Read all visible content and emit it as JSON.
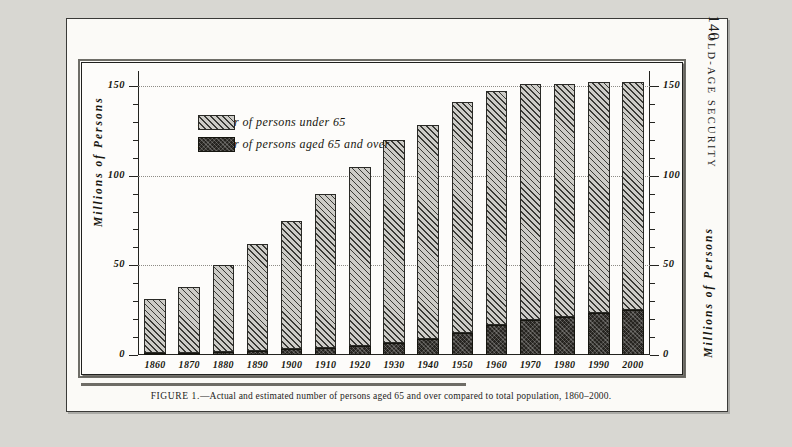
{
  "page": {
    "folio": "140",
    "running_head": "OLD-AGE SECURITY"
  },
  "figure": {
    "caption_label": "FIGURE 1.",
    "caption_text": "—Actual and estimated number of persons aged 65 and over compared to total population, 1860–2000."
  },
  "legend": {
    "items": [
      {
        "label": "Number of persons under 65",
        "pattern": "hatched",
        "color": "#cdccc7"
      },
      {
        "label": "Number of persons aged 65 and over",
        "pattern": "solid-dark",
        "color": "#262420"
      }
    ]
  },
  "ghost_text": {
    "line1": "",
    "line2": "",
    "line3": ""
  },
  "chart_data": {
    "type": "bar",
    "subtype": "stacked",
    "title": "",
    "xlabel": "",
    "ylabel": "Millions of Persons",
    "ylabel_right": "Millions of Persons",
    "ylim": [
      0,
      155
    ],
    "yticks_major": [
      0,
      50,
      100,
      150
    ],
    "ytick_labels": [
      "0",
      "50",
      "100",
      "150"
    ],
    "ytick_minor_step": 10,
    "grid": true,
    "grid_style": "dotted",
    "legend_position": "upper-left-inside",
    "categories": [
      "1860",
      "1870",
      "1880",
      "1890",
      "1900",
      "1910",
      "1920",
      "1930",
      "1940",
      "1950",
      "1960",
      "1970",
      "1980",
      "1990",
      "2000"
    ],
    "series": [
      {
        "name": "Number of persons aged 65 and over",
        "color": "#262420",
        "values": [
          1,
          1.2,
          1.7,
          2.4,
          3.1,
          4.0,
          4.9,
          6.6,
          9.0,
          12.3,
          16.6,
          19.6,
          21.4,
          23.2,
          25.0
        ]
      },
      {
        "name": "Number of persons under 65",
        "color": "#cdccc7",
        "values": [
          30.4,
          37.3,
          48.5,
          60.5,
          72.9,
          88.0,
          101.8,
          116.1,
          122.7,
          139.0,
          149.1,
          153.9,
          155.6,
          157.4,
          159.2
        ]
      }
    ],
    "totals": [
      31.4,
      38.5,
      50.2,
      62.9,
      76.0,
      92.0,
      106.7,
      122.7,
      131.7,
      151.3,
      165.7,
      173.5,
      177.0,
      180.6,
      184.2
    ],
    "plotted_totals": [
      31,
      38,
      50,
      62,
      75,
      90,
      105,
      120,
      128,
      141,
      147,
      151,
      151,
      152,
      152
    ]
  }
}
